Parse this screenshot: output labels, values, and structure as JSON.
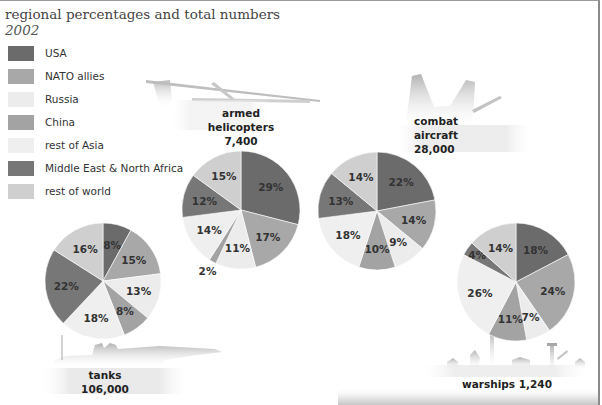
{
  "header": {
    "title": "regional percentages and total numbers",
    "subtitle": "2002"
  },
  "legend": [
    {
      "label": "USA",
      "color": "#6b6b6b"
    },
    {
      "label": "NATO allies",
      "color": "#a8a8a8"
    },
    {
      "label": "Russia",
      "color": "#ececec"
    },
    {
      "label": "China",
      "color": "#a3a3a3"
    },
    {
      "label": "rest of Asia",
      "color": "#efefef"
    },
    {
      "label": "Middle East & North Africa",
      "color": "#777777"
    },
    {
      "label": "rest of world",
      "color": "#cfcfcf"
    }
  ],
  "captions": {
    "helicopters": {
      "line1": "armed",
      "line2": "helicopters",
      "line3": "7,400"
    },
    "aircraft": {
      "line1": "combat",
      "line2": "aircraft",
      "line3": "28,000"
    },
    "tanks": {
      "line1": "tanks",
      "line2": "106,000"
    },
    "warships": {
      "line1": "warships 1,240"
    }
  },
  "chart_data": [
    {
      "type": "pie",
      "title": "armed helicopters",
      "total": 7400,
      "categories": [
        "USA",
        "NATO allies",
        "Russia",
        "China",
        "rest of Asia",
        "Middle East & North Africa",
        "rest of world"
      ],
      "values": [
        29,
        17,
        11,
        2,
        14,
        12,
        15
      ],
      "unit": "%",
      "center": [
        241,
        210
      ],
      "radius": 59
    },
    {
      "type": "pie",
      "title": "combat aircraft",
      "total": 28000,
      "categories": [
        "USA",
        "NATO allies",
        "Russia",
        "China",
        "rest of Asia",
        "Middle East & North Africa",
        "rest of world"
      ],
      "values": [
        22,
        14,
        9,
        10,
        18,
        13,
        14
      ],
      "unit": "%",
      "center": [
        377,
        211
      ],
      "radius": 59
    },
    {
      "type": "pie",
      "title": "tanks",
      "total": 106000,
      "categories": [
        "USA",
        "NATO allies",
        "Russia",
        "China",
        "rest of Asia",
        "Middle East & North Africa",
        "rest of world"
      ],
      "values": [
        8,
        15,
        13,
        8,
        18,
        22,
        16
      ],
      "unit": "%",
      "center": [
        103,
        281
      ],
      "radius": 58
    },
    {
      "type": "pie",
      "title": "warships",
      "total": 1240,
      "categories": [
        "USA",
        "NATO allies",
        "Russia",
        "China",
        "rest of Asia",
        "Middle East & North Africa",
        "rest of world"
      ],
      "values": [
        18,
        24,
        7,
        11,
        26,
        4,
        14
      ],
      "unit": "%",
      "center": [
        516,
        282
      ],
      "radius": 59
    }
  ]
}
